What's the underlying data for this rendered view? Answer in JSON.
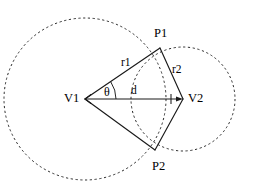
{
  "figure": {
    "type": "geometry-diagram",
    "background_color": "#ffffff",
    "stroke_color": "#1a1a1a",
    "dash_color": "#2b2b2b"
  },
  "labels": {
    "v1": "V1",
    "v2": "V2",
    "p1": "P1",
    "p2": "P2",
    "r1": "r1",
    "r2": "r2",
    "d": "d",
    "theta": "θ"
  },
  "geometry": {
    "canvas": {
      "width": 264,
      "height": 188
    },
    "circles": [
      {
        "name": "circle-v1",
        "cx": 85,
        "cy": 99,
        "r": 81,
        "style": "dashed"
      },
      {
        "name": "circle-v2",
        "cx": 183,
        "cy": 99,
        "r": 52,
        "style": "dashed"
      }
    ],
    "points": [
      {
        "name": "V1",
        "x": 85,
        "y": 99
      },
      {
        "name": "V2",
        "x": 183,
        "y": 99
      },
      {
        "name": "P1",
        "x": 160,
        "y": 48
      },
      {
        "name": "P2",
        "x": 155,
        "y": 150
      }
    ],
    "segments": [
      {
        "name": "V1-P1",
        "label": "r1",
        "from": "V1",
        "to": "P1"
      },
      {
        "name": "V1-P2",
        "label": "",
        "from": "V1",
        "to": "P2"
      },
      {
        "name": "P1-V2",
        "label": "r2",
        "from": "P1",
        "to": "V2"
      },
      {
        "name": "P2-V2",
        "label": "",
        "from": "P2",
        "to": "V2"
      },
      {
        "name": "V1-V2",
        "label": "d",
        "from": "V1",
        "to": "V2"
      }
    ],
    "angle": {
      "name": "theta",
      "at": "V1",
      "between": [
        "V1-V2",
        "V1-P1"
      ]
    }
  },
  "label_positions": {
    "v1": {
      "left": 64,
      "top": 92
    },
    "v2": {
      "left": 188,
      "top": 92
    },
    "p1": {
      "left": 154,
      "top": 27
    },
    "p2": {
      "left": 152,
      "top": 160
    },
    "r1": {
      "left": 121,
      "top": 57
    },
    "r2": {
      "left": 172,
      "top": 64
    },
    "d": {
      "left": 131,
      "top": 85
    },
    "theta": {
      "left": 104,
      "top": 86
    }
  }
}
